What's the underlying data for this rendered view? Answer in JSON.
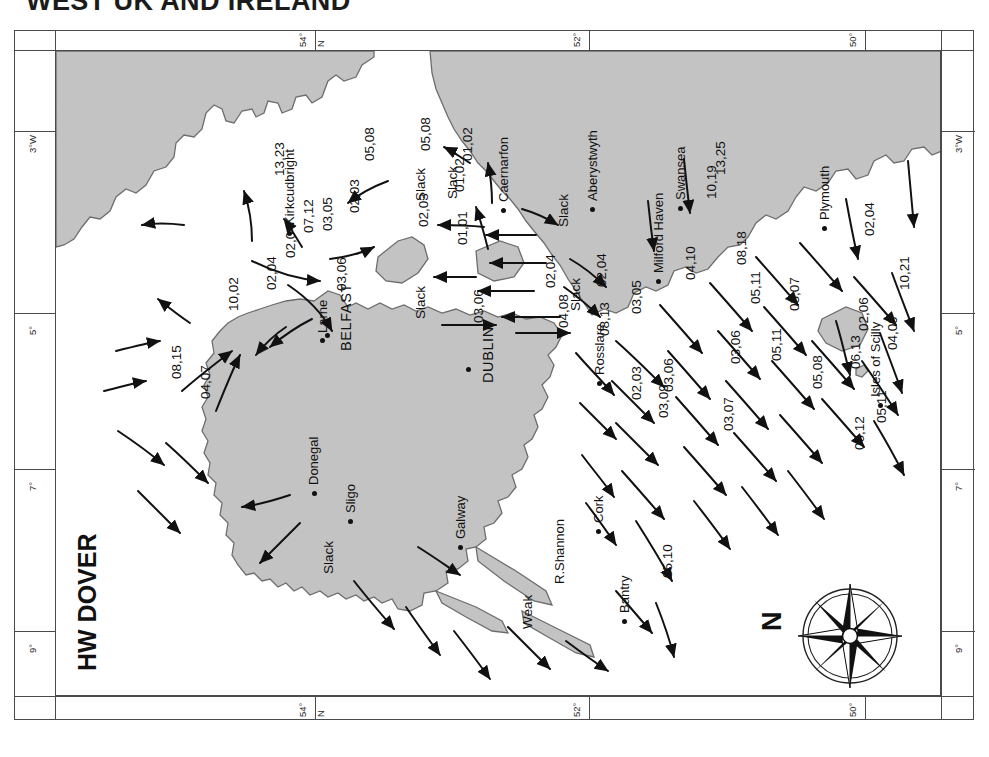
{
  "page": {
    "title": "WEST UK AND IRELAND",
    "tide_state": "HW DOVER"
  },
  "graticule": {
    "top": [
      {
        "label": "54°",
        "x": 282
      },
      {
        "label": "N",
        "x": 300
      },
      {
        "label": "52°",
        "x": 556
      },
      {
        "label": "50°",
        "x": 832
      }
    ],
    "bottom": [
      {
        "label": "54°",
        "x": 282
      },
      {
        "label": "N",
        "x": 300
      },
      {
        "label": "52°",
        "x": 556
      },
      {
        "label": "50°",
        "x": 832
      }
    ],
    "left": [
      {
        "label": "3°W",
        "y": 62
      },
      {
        "label": "5°",
        "y": 244
      },
      {
        "label": "7°",
        "y": 400
      },
      {
        "label": "9°",
        "y": 562
      }
    ],
    "right": [
      {
        "label": "3°W",
        "y": 62
      },
      {
        "label": "5°",
        "y": 244
      },
      {
        "label": "7°",
        "y": 400
      },
      {
        "label": "9°",
        "y": 562
      }
    ]
  },
  "compass": {
    "north_label": "N",
    "points": 8
  },
  "places": [
    {
      "name": "Kirkcudbright",
      "x": 231,
      "y": 180,
      "lx": 226,
      "ly": 174,
      "style": "city"
    },
    {
      "name": "Larne",
      "x": 264,
      "y": 287,
      "lx": 259,
      "ly": 282,
      "style": "city"
    },
    {
      "name": "BELFAST",
      "x": 269,
      "y": 282,
      "lx": 282,
      "ly": 300,
      "style": "city-major"
    },
    {
      "name": "DUBLIN",
      "x": 410,
      "y": 316,
      "lx": 424,
      "ly": 332,
      "style": "city-major"
    },
    {
      "name": "Donegal",
      "x": 256,
      "y": 440,
      "lx": 250,
      "ly": 434,
      "style": "city"
    },
    {
      "name": "Sligo",
      "x": 292,
      "y": 468,
      "lx": 287,
      "ly": 462,
      "style": "city"
    },
    {
      "name": "Galway",
      "x": 402,
      "y": 494,
      "lx": 397,
      "ly": 488,
      "style": "city"
    },
    {
      "name": "R.Shannon",
      "x": 0,
      "y": 0,
      "lx": 496,
      "ly": 533,
      "style": "city"
    },
    {
      "name": "Bantry",
      "x": 566,
      "y": 568,
      "lx": 561,
      "ly": 562,
      "style": "city"
    },
    {
      "name": "Cork",
      "x": 540,
      "y": 478,
      "lx": 535,
      "ly": 472,
      "style": "city"
    },
    {
      "name": "Rosslare",
      "x": 541,
      "y": 330,
      "lx": 536,
      "ly": 324,
      "style": "city"
    },
    {
      "name": "Caernarfon",
      "x": 445,
      "y": 157,
      "lx": 440,
      "ly": 151,
      "style": "city"
    },
    {
      "name": "Aberystwyth",
      "x": 534,
      "y": 156,
      "lx": 529,
      "ly": 150,
      "style": "city"
    },
    {
      "name": "Milford Haven",
      "x": 600,
      "y": 228,
      "lx": 595,
      "ly": 222,
      "style": "city"
    },
    {
      "name": "Swansea",
      "x": 622,
      "y": 155,
      "lx": 617,
      "ly": 149,
      "style": "city"
    },
    {
      "name": "Plymouth",
      "x": 766,
      "y": 175,
      "lx": 761,
      "ly": 169,
      "style": "city"
    },
    {
      "name": "Isles of Scilly",
      "x": 822,
      "y": 352,
      "lx": 812,
      "ly": 346,
      "style": "city"
    }
  ],
  "tidal_rates": [
    {
      "value": "13,23",
      "x": 216,
      "y": 125
    },
    {
      "value": "05,08",
      "x": 306,
      "y": 110
    },
    {
      "value": "05,08",
      "x": 362,
      "y": 100
    },
    {
      "value": "01,02",
      "x": 404,
      "y": 110
    },
    {
      "value": "02,03",
      "x": 291,
      "y": 162
    },
    {
      "value": "03,05",
      "x": 264,
      "y": 180
    },
    {
      "value": "07,12",
      "x": 245,
      "y": 182
    },
    {
      "value": "02,03",
      "x": 360,
      "y": 176
    },
    {
      "value": "01,02",
      "x": 396,
      "y": 141
    },
    {
      "value": "01,01",
      "x": 399,
      "y": 194
    },
    {
      "value": "02,04",
      "x": 227,
      "y": 207
    },
    {
      "value": "02,04",
      "x": 208,
      "y": 239
    },
    {
      "value": "10,02",
      "x": 170,
      "y": 260
    },
    {
      "value": "03,06",
      "x": 278,
      "y": 240
    },
    {
      "value": "08,15",
      "x": 113,
      "y": 328
    },
    {
      "value": "04,07",
      "x": 142,
      "y": 348
    },
    {
      "value": "02,04",
      "x": 487,
      "y": 237
    },
    {
      "value": "02,04",
      "x": 538,
      "y": 236
    },
    {
      "value": "03,05",
      "x": 573,
      "y": 263
    },
    {
      "value": "03,06",
      "x": 415,
      "y": 272
    },
    {
      "value": "04,08",
      "x": 500,
      "y": 277
    },
    {
      "value": "08,13",
      "x": 541,
      "y": 285
    },
    {
      "value": "02,03",
      "x": 573,
      "y": 349
    },
    {
      "value": "03,06",
      "x": 605,
      "y": 341
    },
    {
      "value": "10,19",
      "x": 648,
      "y": 148
    },
    {
      "value": "13,25",
      "x": 657,
      "y": 124
    },
    {
      "value": "04,10",
      "x": 627,
      "y": 229
    },
    {
      "value": "08,18",
      "x": 678,
      "y": 214
    },
    {
      "value": "05,11",
      "x": 692,
      "y": 253
    },
    {
      "value": "02,04",
      "x": 806,
      "y": 185
    },
    {
      "value": "03,07",
      "x": 731,
      "y": 260
    },
    {
      "value": "02,06",
      "x": 800,
      "y": 280
    },
    {
      "value": "10,21",
      "x": 841,
      "y": 239
    },
    {
      "value": "04,09",
      "x": 829,
      "y": 299
    },
    {
      "value": "03,06",
      "x": 672,
      "y": 313
    },
    {
      "value": "05,11",
      "x": 713,
      "y": 310
    },
    {
      "value": "05,08",
      "x": 754,
      "y": 338
    },
    {
      "value": "06,13",
      "x": 792,
      "y": 318
    },
    {
      "value": "03,09",
      "x": 600,
      "y": 367
    },
    {
      "value": "03,07",
      "x": 665,
      "y": 380
    },
    {
      "value": "06,12",
      "x": 796,
      "y": 399
    },
    {
      "value": "05,11",
      "x": 818,
      "y": 372
    },
    {
      "value": "05,10",
      "x": 604,
      "y": 527
    }
  ],
  "slack_labels": [
    {
      "value": "Slack",
      "x": 357,
      "y": 150
    },
    {
      "value": "Slack",
      "x": 389,
      "y": 148
    },
    {
      "value": "Slack",
      "x": 500,
      "y": 176
    },
    {
      "value": "Slack",
      "x": 357,
      "y": 268
    },
    {
      "value": "Slack",
      "x": 512,
      "y": 260
    },
    {
      "value": "Slack",
      "x": 265,
      "y": 523
    },
    {
      "value": "Weak",
      "x": 464,
      "y": 578
    }
  ],
  "colors": {
    "land": "#c3c3c3",
    "coastline": "#6d6d6d",
    "sea": "#ffffff",
    "ink": "#111111",
    "frame": "#4a4a4a"
  }
}
